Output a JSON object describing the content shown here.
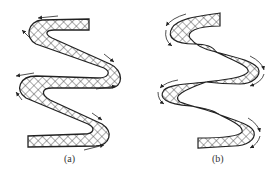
{
  "figure": {
    "panels": [
      {
        "id": "a",
        "label": "(a)",
        "description": "Uniform-width zigzag band, cross-hatched, with edge arrows"
      },
      {
        "id": "b",
        "label": "(b)",
        "description": "Twisted zigzag band pinching at crossing points, cross-hatched, with curved arrows at bends"
      }
    ]
  },
  "colors": {
    "stroke": "#222222",
    "hatch": "#333333",
    "background": "#ffffff"
  }
}
